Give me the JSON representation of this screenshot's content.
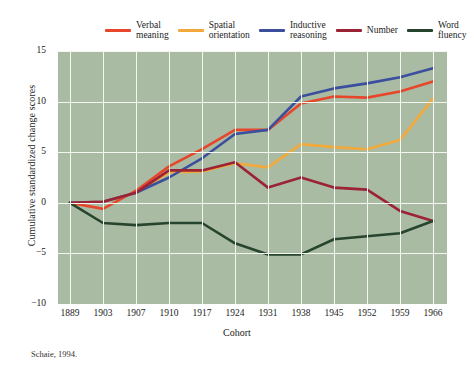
{
  "figure": {
    "source_note": "Schaie, 1994."
  },
  "chart_data": {
    "type": "line",
    "title": "",
    "xlabel": "Cohort",
    "ylabel": "Cumulative standardized change scores",
    "categories": [
      "1889",
      "1903",
      "1907",
      "1910",
      "1917",
      "1924",
      "1931",
      "1938",
      "1945",
      "1952",
      "1959",
      "1966"
    ],
    "ylim": [
      -10,
      15
    ],
    "yticks": [
      15,
      10,
      5,
      0,
      -5,
      -10
    ],
    "ytick_labels": [
      "15",
      "10",
      "5",
      "0",
      "-5",
      "-10"
    ],
    "grid": true,
    "legend_position": "top",
    "plot_background": "#a9bba2",
    "series": [
      {
        "name": "Verbal\nmeaning",
        "legend_label": "Verbal meaning",
        "color": "#e8462a",
        "values": [
          0,
          -0.6,
          1.2,
          3.6,
          5.3,
          7.2,
          7.2,
          9.8,
          10.5,
          10.4,
          11.0,
          12.0
        ]
      },
      {
        "name": "Spatial\norientation",
        "legend_label": "Spatial orientation",
        "color": "#f2a93b",
        "values": [
          0,
          0.1,
          1.0,
          3.0,
          3.1,
          3.9,
          3.5,
          5.8,
          5.5,
          5.3,
          6.2,
          10.3
        ]
      },
      {
        "name": "Inductive\nreasoning",
        "legend_label": "Inductive reasoning",
        "color": "#3b4f9e",
        "values": [
          0,
          0.1,
          1.0,
          2.5,
          4.4,
          6.8,
          7.2,
          10.5,
          11.3,
          11.8,
          12.4,
          13.3
        ]
      },
      {
        "name": "Number",
        "legend_label": "Number",
        "color": "#9b2335",
        "values": [
          0,
          0.1,
          1.0,
          3.2,
          3.2,
          4.0,
          1.5,
          2.5,
          1.5,
          1.3,
          -0.8,
          -1.8
        ]
      },
      {
        "name": "Word\nfluency",
        "legend_label": "Word fluency",
        "color": "#27452e",
        "values": [
          0,
          -2.0,
          -2.2,
          -2.0,
          -2.0,
          -4.0,
          -5.1,
          -5.1,
          -3.6,
          -3.3,
          -3.0,
          -1.8
        ]
      }
    ]
  }
}
